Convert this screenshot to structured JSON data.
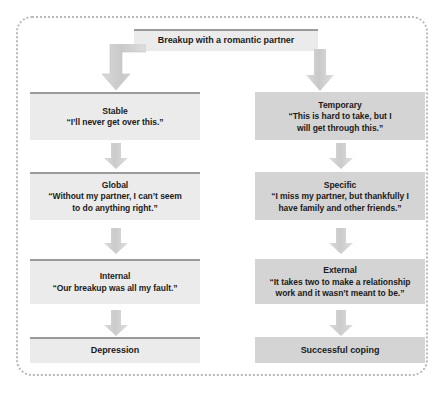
{
  "diagram": {
    "title_node": {
      "label": "Breakup with a romantic partner",
      "style": "light"
    },
    "columns": [
      {
        "name": "maladaptive-attribution-column",
        "nodes": [
          {
            "id": "stable",
            "title": "Stable",
            "quote": "“I’ll never get over this.”",
            "style": "light"
          },
          {
            "id": "global",
            "title": "Global",
            "quote": "“Without my partner, I can’t seem to do anything right.”",
            "style": "light"
          },
          {
            "id": "internal",
            "title": "Internal",
            "quote": "“Our breakup was all my fault.”",
            "style": "light"
          },
          {
            "id": "depression",
            "title": "Depression",
            "quote": "",
            "style": "light"
          }
        ]
      },
      {
        "name": "adaptive-attribution-column",
        "nodes": [
          {
            "id": "temporary",
            "title": "Temporary",
            "quote": "“This is hard to take, but I will get through this.”",
            "style": "dark"
          },
          {
            "id": "specific",
            "title": "Specific",
            "quote": "“I miss my partner, but thankfully I have family and other friends.”",
            "style": "dark"
          },
          {
            "id": "external",
            "title": "External",
            "quote": "“It takes two to make a relationship work and it wasn’t meant to be.”",
            "style": "dark"
          },
          {
            "id": "successful-coping",
            "title": "Successful coping",
            "quote": "",
            "style": "dark"
          }
        ]
      }
    ],
    "colors": {
      "light_box_fill": "#ebebeb",
      "dark_box_fill": "#d4d4d4",
      "box_top_border": "#9a9a9a",
      "arrow_fill": "#cfcfcf",
      "frame_border": "#b9b9b9",
      "text": "#1b1b1b"
    }
  }
}
